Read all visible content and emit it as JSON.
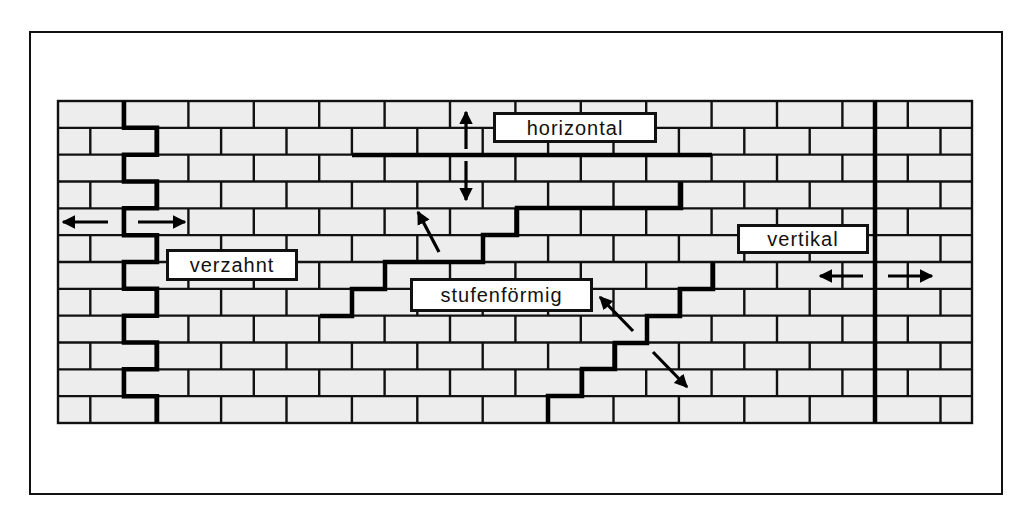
{
  "figure": {
    "colors": {
      "brick_fill": "#ededed",
      "mortar": "#111111",
      "crack": "#000000",
      "background": "#ffffff",
      "label_bg": "#ffffff"
    }
  },
  "wall": {
    "x": 58,
    "y": 101,
    "width": 914,
    "height": 322,
    "rows": 12,
    "brick_length": 65.4,
    "odd_row_joint_start": 123,
    "even_row_joint_start": 90.3
  },
  "labels": {
    "horizontal": "horizontal",
    "verzahnt": "verzahnt",
    "stufenfoermig": "stufenförmig",
    "vertikal": "vertikal"
  },
  "cracks": {
    "verzahnt": {
      "x_odd": 124,
      "x_even": 157
    },
    "horizontal": {
      "y": 155,
      "x1": 352,
      "x2": 712
    },
    "stufenfoermig_upper": [
      [
        320,
        316
      ],
      [
        352,
        316
      ],
      [
        352,
        289
      ],
      [
        385,
        289
      ],
      [
        385,
        262
      ],
      [
        483,
        262
      ],
      [
        483,
        235
      ],
      [
        517,
        235
      ],
      [
        517,
        208
      ],
      [
        681,
        208
      ],
      [
        681,
        182
      ]
    ],
    "stufenfoermig_lower": [
      [
        548,
        423
      ],
      [
        548,
        396
      ],
      [
        582,
        396
      ],
      [
        582,
        369
      ],
      [
        615,
        369
      ],
      [
        615,
        343
      ],
      [
        647,
        343
      ],
      [
        647,
        316
      ],
      [
        680,
        316
      ],
      [
        680,
        289
      ],
      [
        713,
        289
      ],
      [
        713,
        262
      ]
    ],
    "vertikal": {
      "x": 875,
      "y1": 101,
      "y2": 423
    }
  },
  "arrows": [
    {
      "name": "verzahnt-left-arrow",
      "x1": 108,
      "y1": 222,
      "x2": 63,
      "y2": 222
    },
    {
      "name": "verzahnt-right-arrow",
      "x1": 138,
      "y1": 222,
      "x2": 185,
      "y2": 222
    },
    {
      "name": "horizontal-up-arrow",
      "x1": 466,
      "y1": 149,
      "x2": 466,
      "y2": 112
    },
    {
      "name": "horizontal-down-arrow",
      "x1": 466,
      "y1": 161,
      "x2": 466,
      "y2": 200
    },
    {
      "name": "stufen-upper-arrow",
      "x1": 439,
      "y1": 252,
      "x2": 418,
      "y2": 212
    },
    {
      "name": "stufen-lower-up-arrow",
      "x1": 633,
      "y1": 331,
      "x2": 600,
      "y2": 297
    },
    {
      "name": "stufen-lower-down-arrow",
      "x1": 653,
      "y1": 352,
      "x2": 687,
      "y2": 387
    },
    {
      "name": "vertikal-left-arrow",
      "x1": 863,
      "y1": 276,
      "x2": 820,
      "y2": 276
    },
    {
      "name": "vertikal-right-arrow",
      "x1": 888,
      "y1": 276,
      "x2": 932,
      "y2": 276
    }
  ]
}
